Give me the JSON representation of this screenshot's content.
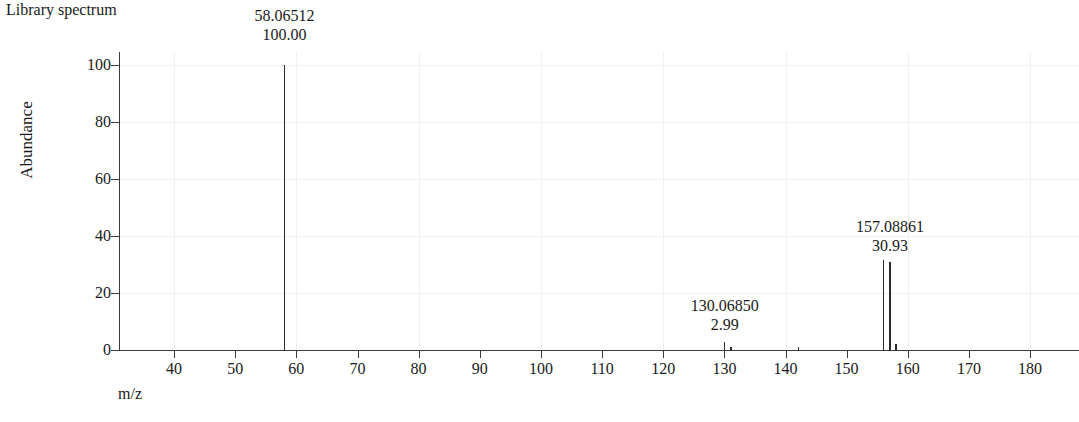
{
  "header": {
    "title": "Library spectrum"
  },
  "axes": {
    "ylabel": "Abundance",
    "xlabel": "m/z",
    "y_ticks": [
      0,
      20,
      40,
      60,
      80,
      100
    ],
    "y_tick_labels": [
      "0",
      "20",
      "40",
      "60",
      "80",
      "100"
    ],
    "x_ticks": [
      40,
      50,
      60,
      70,
      80,
      90,
      100,
      110,
      120,
      130,
      140,
      150,
      160,
      170,
      180
    ],
    "x_tick_labels": [
      "40",
      "50",
      "60",
      "70",
      "80",
      "90",
      "100",
      "110",
      "120",
      "130",
      "140",
      "150",
      "160",
      "170",
      "180"
    ]
  },
  "chart_data": {
    "type": "bar",
    "title": "Library spectrum",
    "xlabel": "m/z",
    "ylabel": "Abundance",
    "xlim": [
      31,
      188
    ],
    "ylim": [
      0,
      106
    ],
    "grid": true,
    "legend": "none",
    "x": [
      58.06512,
      130.0685,
      131.07,
      142.08,
      156.08,
      157.08861,
      158.09
    ],
    "values": [
      100.0,
      2.99,
      1.1,
      0.9,
      31.6,
      30.93,
      2.2
    ],
    "annotations": [
      {
        "mz": "58.06512",
        "abundance": "100.00",
        "x": 58.06512,
        "y": 100.0
      },
      {
        "mz": "130.06850",
        "abundance": "2.99",
        "x": 130.0685,
        "y": 2.99
      },
      {
        "mz": "157.08861",
        "abundance": "30.93",
        "x": 157.08861,
        "y": 30.93
      }
    ]
  }
}
